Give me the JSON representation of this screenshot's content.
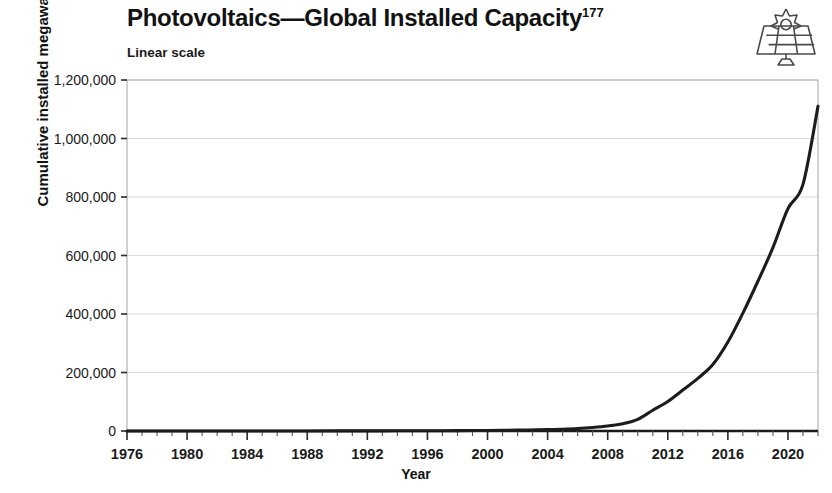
{
  "header": {
    "title": "Photovoltaics—Global Installed Capacity",
    "title_footnote": "177",
    "subtitle": "Linear scale"
  },
  "icons": {
    "solar_panel": "solar-panel-icon"
  },
  "chart_data": {
    "type": "line",
    "title": "Photovoltaics—Global Installed Capacity",
    "subtitle": "Linear scale",
    "xlabel": "Year",
    "ylabel": "Cumulative installed megawatts (peak)",
    "scale": "linear",
    "grid": true,
    "legend": "none",
    "xlim": [
      1976,
      2022
    ],
    "ylim": [
      0,
      1200000
    ],
    "xtick_step": 4,
    "xminor_tick_step": 1,
    "ytick_step": 200000,
    "xticks": [
      1976,
      1980,
      1984,
      1988,
      1992,
      1996,
      2000,
      2004,
      2008,
      2012,
      2016,
      2020
    ],
    "yticks": [
      0,
      200000,
      400000,
      600000,
      800000,
      1000000,
      1200000
    ],
    "ytick_labels": [
      "0",
      "200,000",
      "400,000",
      "600,000",
      "800,000",
      "1,000,000",
      "1,200,000"
    ],
    "series": [
      {
        "name": "Cumulative installed PV capacity",
        "color": "#1c1c1c",
        "x": [
          1976,
          1978,
          1980,
          1982,
          1984,
          1986,
          1988,
          1990,
          1992,
          1994,
          1996,
          1998,
          2000,
          2002,
          2004,
          2005,
          2006,
          2007,
          2008,
          2009,
          2010,
          2011,
          2012,
          2013,
          2014,
          2015,
          2016,
          2017,
          2018,
          2019,
          2020,
          2021,
          2022
        ],
        "values": [
          0,
          100,
          300,
          600,
          1000,
          1600,
          2400,
          3500,
          5000,
          7000,
          9500,
          13000,
          19000,
          30000,
          47000,
          62000,
          85000,
          120000,
          170000,
          250000,
          400000,
          710000,
          1010000,
          1400000,
          1800000,
          2270000,
          3040000,
          4030000,
          5120000,
          6270000,
          7600000,
          8430000,
          11100000
        ],
        "values_note": "y-values above are scaled ×10 for storage; use values_mw",
        "values_mw": [
          0,
          10,
          30,
          60,
          100,
          160,
          240,
          350,
          500,
          700,
          950,
          1300,
          1900,
          3000,
          4700,
          6200,
          8500,
          12000,
          17000,
          25000,
          40000,
          71000,
          101000,
          140000,
          180000,
          227000,
          304000,
          403000,
          512000,
          627000,
          760000,
          843000,
          1110000
        ]
      }
    ],
    "annotations": [
      {
        "text": "curve is flat near zero from 1976 through ~2008"
      },
      {
        "text": "steep exponential rise begins ~2009"
      },
      {
        "text": "ends at approximately 1,110,000 MW in 2022"
      }
    ]
  },
  "axes": {
    "x_title": "Year",
    "y_title": "Cumulative installed megawatts (peak)"
  },
  "colors": {
    "line": "#1c1c1c",
    "grid": "#d9d9d9",
    "frame": "#b3b3b3",
    "text": "#1a1a1a",
    "background": "#ffffff"
  }
}
